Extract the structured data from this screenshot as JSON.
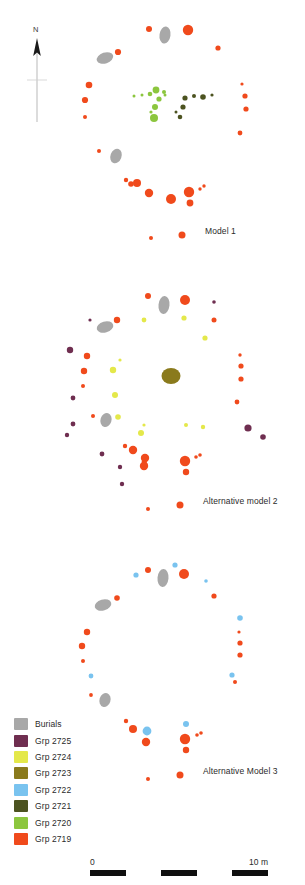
{
  "figure": {
    "title_labels": [
      {
        "id": "model-1",
        "text": "Model 1",
        "x": 205,
        "y": 232
      },
      {
        "id": "alt-model-2",
        "text": "Alternative model 2",
        "x": 203,
        "y": 502
      },
      {
        "id": "alt-model-3",
        "text": "Alternative Model 3",
        "x": 203,
        "y": 772
      }
    ],
    "north_arrow": {
      "label": "N",
      "x": 37,
      "y": 28,
      "line_top": 40,
      "line_bottom": 122
    },
    "colors": {
      "burials": "#a8a8a8",
      "grp_2725": "#6f2e50",
      "grp_2724": "#e4e84a",
      "grp_2723": "#8a7a1c",
      "grp_2722": "#79c3ef",
      "grp_2721": "#4c5320",
      "grp_2720": "#8cc63e",
      "grp_2719": "#f04a1c",
      "label_text": "#2b2b2b",
      "scalebar_dark": "#0f0f0f"
    }
  },
  "legend": {
    "items": [
      {
        "label": "Burials",
        "color": "#a8a8a8"
      },
      {
        "label": "Grp 2725",
        "color": "#6f2e50"
      },
      {
        "label": "Grp 2724",
        "color": "#e4e84a"
      },
      {
        "label": "Grp 2723",
        "color": "#8a7a1c"
      },
      {
        "label": "Grp 2722",
        "color": "#79c3ef"
      },
      {
        "label": "Grp 2721",
        "color": "#4c5320"
      },
      {
        "label": "Grp 2720",
        "color": "#8cc63e"
      },
      {
        "label": "Grp 2719",
        "color": "#f04a1c"
      }
    ]
  },
  "scalebar": {
    "left_label": "0",
    "right_label": "10 m",
    "segments": [
      "dark",
      "light",
      "dark",
      "light",
      "dark"
    ]
  },
  "chart_data": {
    "type": "scatter",
    "xlabel": "",
    "ylabel": "",
    "grid": false,
    "legend_position": "bottom-left",
    "scale": {
      "bar_label_left": "0",
      "bar_label_right": "10 m",
      "bar_length_px": 178
    },
    "north_arrow": "N (up)",
    "series_legend": [
      {
        "name": "Burials",
        "color": "#a8a8a8"
      },
      {
        "name": "Grp 2725",
        "color": "#6f2e50"
      },
      {
        "name": "Grp 2724",
        "color": "#e4e84a"
      },
      {
        "name": "Grp 2723",
        "color": "#8a7a1c"
      },
      {
        "name": "Grp 2722",
        "color": "#79c3ef"
      },
      {
        "name": "Grp 2721",
        "color": "#4c5320"
      },
      {
        "name": "Grp 2720",
        "color": "#8cc63e"
      },
      {
        "name": "Grp 2719",
        "color": "#f04a1c"
      }
    ],
    "panels": [
      {
        "name": "Model 1",
        "label_x": 205,
        "label_y": 232,
        "features": [
          {
            "g": "grp_2719",
            "x": 149,
            "y": 29,
            "r": 3.0
          },
          {
            "g": "burials",
            "x": 165,
            "y": 35,
            "rx": 5.5,
            "ry": 8.5,
            "rot": 8
          },
          {
            "g": "grp_2719",
            "x": 188,
            "y": 30,
            "r": 5.2
          },
          {
            "g": "grp_2719",
            "x": 218,
            "y": 48,
            "r": 2.6
          },
          {
            "g": "grp_2719",
            "x": 118,
            "y": 52,
            "r": 3.1
          },
          {
            "g": "burials",
            "x": 105,
            "y": 58,
            "rx": 8.5,
            "ry": 5.5,
            "rot": -18
          },
          {
            "g": "grp_2719",
            "x": 89,
            "y": 85,
            "r": 3.3
          },
          {
            "g": "grp_2719",
            "x": 85,
            "y": 100,
            "r": 3.1
          },
          {
            "g": "grp_2719",
            "x": 85,
            "y": 117,
            "r": 2.0
          },
          {
            "g": "grp_2719",
            "x": 242,
            "y": 84,
            "r": 1.6
          },
          {
            "g": "grp_2719",
            "x": 245,
            "y": 96,
            "r": 2.6
          },
          {
            "g": "grp_2719",
            "x": 246,
            "y": 109,
            "r": 2.6
          },
          {
            "g": "grp_2719",
            "x": 240,
            "y": 133,
            "r": 2.4
          },
          {
            "g": "grp_2720",
            "x": 134,
            "y": 96,
            "r": 1.5
          },
          {
            "g": "grp_2720",
            "x": 142,
            "y": 95,
            "r": 1.5
          },
          {
            "g": "grp_2720",
            "x": 150,
            "y": 94,
            "r": 2.3
          },
          {
            "g": "grp_2720",
            "x": 156,
            "y": 90,
            "r": 3.4
          },
          {
            "g": "grp_2720",
            "x": 164,
            "y": 92,
            "r": 2.0
          },
          {
            "g": "grp_2720",
            "x": 159,
            "y": 99,
            "r": 2.6
          },
          {
            "g": "grp_2720",
            "x": 165,
            "y": 95,
            "r": 1.5
          },
          {
            "g": "grp_2720",
            "x": 155,
            "y": 107,
            "r": 3.0
          },
          {
            "g": "grp_2720",
            "x": 154,
            "y": 118,
            "r": 4.0
          },
          {
            "g": "grp_2720",
            "x": 151,
            "y": 112,
            "r": 1.6
          },
          {
            "g": "grp_2721",
            "x": 185,
            "y": 98,
            "r": 2.6
          },
          {
            "g": "grp_2721",
            "x": 194,
            "y": 96,
            "r": 2.0
          },
          {
            "g": "grp_2721",
            "x": 203,
            "y": 97,
            "r": 2.8
          },
          {
            "g": "grp_2721",
            "x": 212,
            "y": 95,
            "r": 1.6
          },
          {
            "g": "grp_2721",
            "x": 183,
            "y": 107,
            "r": 2.6
          },
          {
            "g": "grp_2721",
            "x": 180,
            "y": 117,
            "r": 2.3
          },
          {
            "g": "grp_2721",
            "x": 176,
            "y": 112,
            "r": 1.5
          },
          {
            "g": "grp_2719",
            "x": 99,
            "y": 151,
            "r": 2.0
          },
          {
            "g": "burials",
            "x": 116,
            "y": 156,
            "rx": 5.5,
            "ry": 7.5,
            "rot": 20
          },
          {
            "g": "grp_2719",
            "x": 126,
            "y": 180,
            "r": 2.2
          },
          {
            "g": "grp_2719",
            "x": 131,
            "y": 184,
            "r": 2.8
          },
          {
            "g": "grp_2719",
            "x": 137,
            "y": 183,
            "r": 4.0
          },
          {
            "g": "grp_2719",
            "x": 149,
            "y": 193,
            "r": 4.2
          },
          {
            "g": "grp_2719",
            "x": 171,
            "y": 199,
            "r": 5.0
          },
          {
            "g": "grp_2719",
            "x": 189,
            "y": 192,
            "r": 5.2
          },
          {
            "g": "grp_2719",
            "x": 190,
            "y": 203,
            "r": 3.4
          },
          {
            "g": "grp_2719",
            "x": 200,
            "y": 189,
            "r": 1.7
          },
          {
            "g": "grp_2719",
            "x": 204,
            "y": 186,
            "r": 1.7
          },
          {
            "g": "grp_2719",
            "x": 151,
            "y": 238,
            "r": 2.0
          },
          {
            "g": "grp_2719",
            "x": 182,
            "y": 235,
            "r": 3.5
          }
        ]
      },
      {
        "name": "Alternative model 2",
        "label_x": 203,
        "label_y": 502,
        "features": [
          {
            "g": "grp_2719",
            "x": 148,
            "y": 296,
            "r": 3.0
          },
          {
            "g": "burials",
            "x": 164,
            "y": 305,
            "rx": 5.5,
            "ry": 9.0,
            "rot": 6
          },
          {
            "g": "grp_2719",
            "x": 185,
            "y": 300,
            "r": 5.0
          },
          {
            "g": "grp_2725",
            "x": 214,
            "y": 302,
            "r": 1.8
          },
          {
            "g": "grp_2724",
            "x": 144,
            "y": 320,
            "r": 2.4
          },
          {
            "g": "grp_2724",
            "x": 184,
            "y": 318,
            "r": 2.6
          },
          {
            "g": "grp_2719",
            "x": 214,
            "y": 320,
            "r": 2.5
          },
          {
            "g": "grp_2725",
            "x": 90,
            "y": 320,
            "r": 1.6
          },
          {
            "g": "burials",
            "x": 105,
            "y": 327,
            "rx": 8.5,
            "ry": 5.5,
            "rot": -16
          },
          {
            "g": "grp_2719",
            "x": 117,
            "y": 320,
            "r": 3.2
          },
          {
            "g": "grp_2724",
            "x": 205,
            "y": 338,
            "r": 2.6
          },
          {
            "g": "grp_2725",
            "x": 70,
            "y": 350,
            "r": 3.2
          },
          {
            "g": "grp_2719",
            "x": 87,
            "y": 356,
            "r": 3.2
          },
          {
            "g": "grp_2719",
            "x": 84,
            "y": 371,
            "r": 3.2
          },
          {
            "g": "grp_2719",
            "x": 83,
            "y": 386,
            "r": 2.0
          },
          {
            "g": "grp_2724",
            "x": 120,
            "y": 360,
            "r": 1.6
          },
          {
            "g": "grp_2724",
            "x": 113,
            "y": 370,
            "r": 3.2
          },
          {
            "g": "grp_2724",
            "x": 115,
            "y": 395,
            "r": 3.0
          },
          {
            "g": "grp_2723",
            "x": 171,
            "y": 376,
            "rx": 9.5,
            "ry": 8.0,
            "rot": 0
          },
          {
            "g": "grp_2719",
            "x": 240,
            "y": 355,
            "r": 1.7
          },
          {
            "g": "grp_2719",
            "x": 241,
            "y": 366,
            "r": 2.6
          },
          {
            "g": "grp_2719",
            "x": 241,
            "y": 379,
            "r": 2.6
          },
          {
            "g": "grp_2719",
            "x": 237,
            "y": 402,
            "r": 2.4
          },
          {
            "g": "grp_2725",
            "x": 73,
            "y": 398,
            "r": 2.4
          },
          {
            "g": "grp_2725",
            "x": 73,
            "y": 424,
            "r": 2.4
          },
          {
            "g": "grp_2725",
            "x": 67,
            "y": 435,
            "r": 2.2
          },
          {
            "g": "grp_2719",
            "x": 93,
            "y": 416,
            "r": 2.0
          },
          {
            "g": "burials",
            "x": 106,
            "y": 420,
            "rx": 5.5,
            "ry": 7.0,
            "rot": 18
          },
          {
            "g": "grp_2724",
            "x": 118,
            "y": 417,
            "r": 2.8
          },
          {
            "g": "grp_2724",
            "x": 141,
            "y": 433,
            "r": 3.0
          },
          {
            "g": "grp_2724",
            "x": 144,
            "y": 425,
            "r": 1.6
          },
          {
            "g": "grp_2724",
            "x": 186,
            "y": 425,
            "r": 2.0
          },
          {
            "g": "grp_2724",
            "x": 203,
            "y": 427,
            "r": 2.2
          },
          {
            "g": "grp_2725",
            "x": 248,
            "y": 428,
            "r": 3.6
          },
          {
            "g": "grp_2725",
            "x": 263,
            "y": 437,
            "r": 2.8
          },
          {
            "g": "grp_2719",
            "x": 125,
            "y": 446,
            "r": 2.2
          },
          {
            "g": "grp_2719",
            "x": 133,
            "y": 450,
            "r": 4.2
          },
          {
            "g": "grp_2719",
            "x": 145,
            "y": 458,
            "r": 4.2
          },
          {
            "g": "grp_2725",
            "x": 102,
            "y": 454,
            "r": 2.4
          },
          {
            "g": "grp_2725",
            "x": 120,
            "y": 467,
            "r": 2.2
          },
          {
            "g": "grp_2719",
            "x": 144,
            "y": 462,
            "r": 2.4
          },
          {
            "g": "grp_2719",
            "x": 145,
            "y": 462,
            "r": 1.5
          },
          {
            "g": "grp_2719",
            "x": 145,
            "y": 463,
            "r": 1.5
          },
          {
            "g": "grp_2719",
            "x": 145,
            "y": 463,
            "r": 1.5
          },
          {
            "g": "grp_2719",
            "x": 146,
            "y": 464,
            "r": 1.5
          },
          {
            "g": "grp_2719",
            "x": 145,
            "y": 464,
            "r": 1.4
          },
          {
            "g": "grp_2719",
            "x": 144,
            "y": 466,
            "r": 4.2
          },
          {
            "g": "grp_2719",
            "x": 185,
            "y": 461,
            "r": 5.2
          },
          {
            "g": "grp_2719",
            "x": 186,
            "y": 472,
            "r": 3.2
          },
          {
            "g": "grp_2719",
            "x": 196,
            "y": 457,
            "r": 1.8
          },
          {
            "g": "grp_2719",
            "x": 200,
            "y": 455,
            "r": 1.8
          },
          {
            "g": "grp_2725",
            "x": 122,
            "y": 484,
            "r": 2.2
          },
          {
            "g": "grp_2719",
            "x": 148,
            "y": 509,
            "r": 2.0
          },
          {
            "g": "grp_2719",
            "x": 180,
            "y": 505,
            "r": 3.5
          }
        ]
      },
      {
        "name": "Alternative Model 3",
        "label_x": 203,
        "label_y": 772,
        "features": [
          {
            "g": "grp_2722",
            "x": 175,
            "y": 565,
            "r": 2.6
          },
          {
            "g": "grp_2722",
            "x": 136,
            "y": 575,
            "r": 2.6
          },
          {
            "g": "grp_2719",
            "x": 148,
            "y": 570,
            "r": 3.0
          },
          {
            "g": "burials",
            "x": 163,
            "y": 578,
            "rx": 5.5,
            "ry": 9.0,
            "rot": 5
          },
          {
            "g": "grp_2719",
            "x": 184,
            "y": 574,
            "r": 5.0
          },
          {
            "g": "grp_2722",
            "x": 206,
            "y": 581,
            "r": 1.8
          },
          {
            "g": "grp_2719",
            "x": 214,
            "y": 596,
            "r": 2.6
          },
          {
            "g": "grp_2719",
            "x": 117,
            "y": 598,
            "r": 2.8
          },
          {
            "g": "burials",
            "x": 103,
            "y": 605,
            "rx": 8.5,
            "ry": 5.5,
            "rot": -16
          },
          {
            "g": "grp_2722",
            "x": 240,
            "y": 618,
            "r": 2.8
          },
          {
            "g": "grp_2719",
            "x": 87,
            "y": 632,
            "r": 3.2
          },
          {
            "g": "grp_2719",
            "x": 82,
            "y": 646,
            "r": 3.2
          },
          {
            "g": "grp_2719",
            "x": 83,
            "y": 661,
            "r": 2.0
          },
          {
            "g": "grp_2719",
            "x": 239,
            "y": 632,
            "r": 1.6
          },
          {
            "g": "grp_2719",
            "x": 240,
            "y": 643,
            "r": 2.6
          },
          {
            "g": "grp_2719",
            "x": 240,
            "y": 655,
            "r": 2.6
          },
          {
            "g": "grp_2722",
            "x": 232,
            "y": 675,
            "r": 2.6
          },
          {
            "g": "grp_2719",
            "x": 235,
            "y": 682,
            "r": 2.0
          },
          {
            "g": "grp_2722",
            "x": 91,
            "y": 676,
            "r": 2.4
          },
          {
            "g": "grp_2719",
            "x": 91,
            "y": 695,
            "r": 1.9
          },
          {
            "g": "burials",
            "x": 105,
            "y": 700,
            "rx": 5.5,
            "ry": 7.0,
            "rot": 18
          },
          {
            "g": "grp_2719",
            "x": 126,
            "y": 721,
            "r": 2.2
          },
          {
            "g": "grp_2719",
            "x": 133,
            "y": 729,
            "r": 4.0
          },
          {
            "g": "grp_2722",
            "x": 147,
            "y": 731,
            "r": 4.4
          },
          {
            "g": "grp_2719",
            "x": 146,
            "y": 742,
            "r": 4.2
          },
          {
            "g": "grp_2722",
            "x": 186,
            "y": 724,
            "r": 3.0
          },
          {
            "g": "grp_2719",
            "x": 185,
            "y": 739,
            "r": 5.2
          },
          {
            "g": "grp_2719",
            "x": 186,
            "y": 750,
            "r": 3.2
          },
          {
            "g": "grp_2719",
            "x": 197,
            "y": 735,
            "r": 1.8
          },
          {
            "g": "grp_2719",
            "x": 201,
            "y": 733,
            "r": 1.8
          },
          {
            "g": "grp_2719",
            "x": 148,
            "y": 779,
            "r": 2.0
          },
          {
            "g": "grp_2719",
            "x": 180,
            "y": 775,
            "r": 3.5
          }
        ]
      }
    ]
  }
}
